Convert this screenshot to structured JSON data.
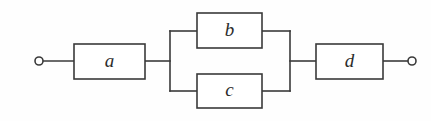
{
  "diagram": {
    "background_color": "#fefefe",
    "line_color": "#3a3a3a",
    "block_fill_color": "#ffffff",
    "label_color": "#2b2b2b",
    "blocks": [
      {
        "id": "a",
        "label": "a",
        "x": 74,
        "y": 44,
        "width": 71,
        "height": 35,
        "branch": "series-left"
      },
      {
        "id": "b",
        "label": "b",
        "x": 197,
        "y": 13,
        "width": 65,
        "height": 35,
        "branch": "parallel-top"
      },
      {
        "id": "c",
        "label": "c",
        "x": 197,
        "y": 74,
        "width": 65,
        "height": 34,
        "branch": "parallel-bottom"
      },
      {
        "id": "d",
        "label": "d",
        "x": 316,
        "y": 44,
        "width": 67,
        "height": 35,
        "branch": "series-right"
      }
    ],
    "terminals": [
      {
        "id": "left-terminal",
        "x": 39,
        "y": 61,
        "r": 4
      },
      {
        "id": "right-terminal",
        "x": 412,
        "y": 61,
        "r": 4
      }
    ],
    "wires": [
      {
        "id": "wire-left-terminal-to-a",
        "points": "43,61 74,61"
      },
      {
        "id": "wire-a-to-split",
        "points": "145,61 170,61"
      },
      {
        "id": "wire-split-vertical",
        "points": "170,31 170,91"
      },
      {
        "id": "wire-split-to-b",
        "points": "170,31 197,31"
      },
      {
        "id": "wire-split-to-c",
        "points": "170,91 197,91"
      },
      {
        "id": "wire-b-to-join",
        "points": "262,31 290,31"
      },
      {
        "id": "wire-c-to-join",
        "points": "262,91 290,91"
      },
      {
        "id": "wire-join-vertical",
        "points": "290,31 290,91"
      },
      {
        "id": "wire-join-to-d",
        "points": "290,61 316,61"
      },
      {
        "id": "wire-d-to-right-terminal",
        "points": "383,61 408,61"
      }
    ]
  }
}
